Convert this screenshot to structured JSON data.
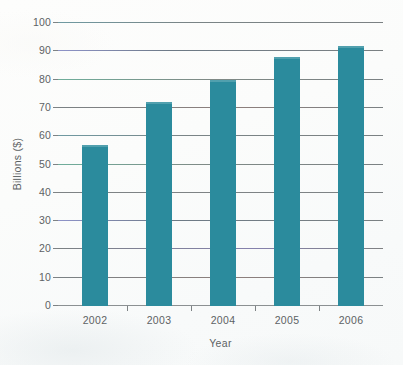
{
  "chart_data": {
    "type": "bar",
    "title": "",
    "subtitle": "",
    "xlabel": "Year",
    "ylabel": "Billions ($)",
    "categories": [
      "2002",
      "2003",
      "2004",
      "2005",
      "2006"
    ],
    "values": [
      57,
      72,
      80,
      88,
      92
    ],
    "series": [
      {
        "name": "",
        "values": [
          57,
          72,
          80,
          88,
          92
        ]
      }
    ],
    "ylim": [
      0,
      100
    ],
    "ytick_labels": [
      "0",
      "10",
      "20",
      "30",
      "40",
      "50",
      "60",
      "70",
      "80",
      "90",
      "100"
    ],
    "ytick_values": [
      0,
      10,
      20,
      30,
      40,
      50,
      60,
      70,
      80,
      90,
      100
    ],
    "ytick_step": 10,
    "grid": true,
    "grid_axis": "y",
    "legend": false,
    "legend_position": "none",
    "annotations": [],
    "data_labels": false,
    "bar_color": "#2b8b9d",
    "gridline_color": "#7e8385",
    "axis_text_color": "#5d6264",
    "background_color": "#fbfcfb"
  }
}
